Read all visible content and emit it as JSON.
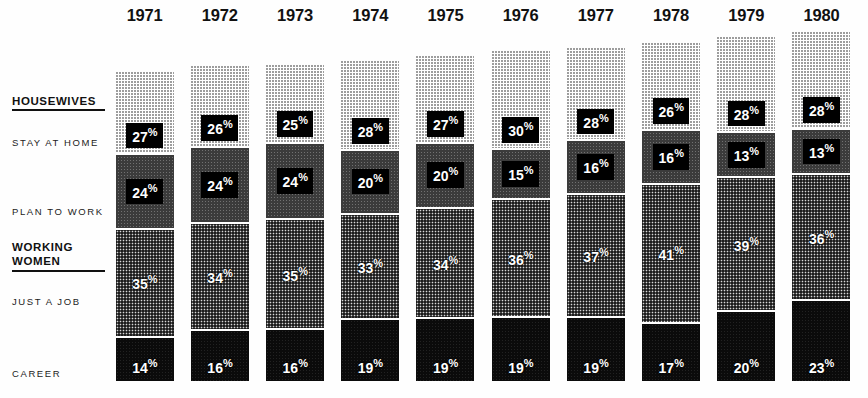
{
  "chart_data": {
    "type": "bar",
    "subtype": "stacked-bar",
    "title": "",
    "xlabel": "",
    "ylabel": "",
    "grid": false,
    "legend_position": "left-row-labels",
    "categories": [
      "1971",
      "1972",
      "1973",
      "1974",
      "1975",
      "1976",
      "1977",
      "1978",
      "1979",
      "1980"
    ],
    "group_labels": [
      {
        "name": "HOUSEWIVES",
        "emphasis": "bold-underlined",
        "segments": [
          "STAY AT HOME",
          "PLAN TO WORK"
        ]
      },
      {
        "name": "WORKING WOMEN",
        "emphasis": "bold-underlined",
        "segments": [
          "JUST A JOB",
          "CAREER"
        ]
      }
    ],
    "series": [
      {
        "name": "STAY AT HOME",
        "tone": "light-halftone",
        "values": [
          27,
          26,
          25,
          28,
          27,
          30,
          28,
          26,
          28,
          28
        ]
      },
      {
        "name": "PLAN TO WORK",
        "tone": "medium-halftone",
        "values": [
          24,
          24,
          24,
          20,
          20,
          15,
          16,
          16,
          13,
          13
        ]
      },
      {
        "name": "JUST A JOB",
        "tone": "dark-halftone",
        "values": [
          35,
          34,
          35,
          33,
          34,
          36,
          37,
          41,
          39,
          36
        ]
      },
      {
        "name": "CAREER",
        "tone": "solid-black",
        "values": [
          14,
          16,
          16,
          19,
          19,
          19,
          19,
          17,
          20,
          23
        ]
      }
    ],
    "value_labels": {
      "STAY AT HOME": [
        "27%",
        "26%",
        "25%",
        "28%",
        "27%",
        "30%",
        "28%",
        "26%",
        "28%",
        "28%"
      ],
      "PLAN TO WORK": [
        "24%",
        "24%",
        "24%",
        "20%",
        "20%",
        "15%",
        "16%",
        "16%",
        "13%",
        "13%"
      ],
      "JUST A JOB": [
        "35%",
        "34%",
        "35%",
        "33%",
        "34%",
        "36%",
        "37%",
        "41%",
        "39%",
        "36%"
      ],
      "CAREER": [
        "14%",
        "16%",
        "16%",
        "19%",
        "19%",
        "19%",
        "19%",
        "17%",
        "20%",
        "23%"
      ]
    },
    "totals": [
      100,
      100,
      100,
      100,
      100,
      100,
      100,
      100,
      100,
      100
    ]
  },
  "header": {
    "years": [
      "1971",
      "1972",
      "1973",
      "1974",
      "1975",
      "1976",
      "1977",
      "1978",
      "1979",
      "1980"
    ]
  },
  "row_labels": {
    "housewives": "HOUSEWIVES",
    "stay_at_home": "STAY AT HOME",
    "plan_to_work": "PLAN TO WORK",
    "working_women_line1": "WORKING",
    "working_women_line2": "WOMEN",
    "just_a_job": "JUST A JOB",
    "career": "CAREER"
  },
  "colors": {
    "page_background": "#fefefe",
    "ink": "#111111",
    "stay_at_home_tone": "#d9d9d9",
    "plan_to_work_tone": "#6e6e6e",
    "just_a_job_tone": "#2e2e2e",
    "career_tone": "#0b0b0b",
    "label_box_fill": "#000000",
    "label_text": "#ffffff"
  }
}
